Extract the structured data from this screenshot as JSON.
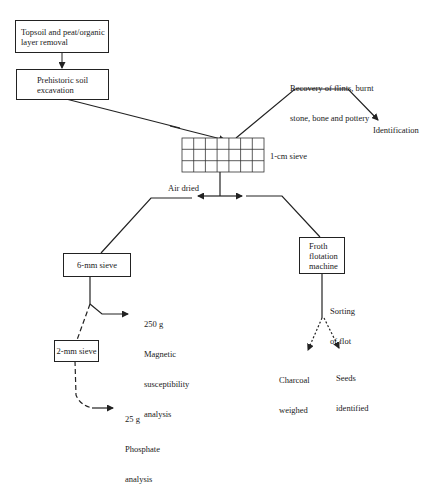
{
  "diagram": {
    "type": "flowchart",
    "nodes": {
      "topsoil": {
        "label": "Topsoil and peat/organic layer removal",
        "line1": "Topsoil and peat/organic",
        "line2": "layer removal"
      },
      "prehistoric": {
        "label": "Prehistoric soil excavation",
        "line1": "Prehistoric soil",
        "line2": "excavation"
      },
      "sieve_1cm": {
        "label": "1-cm sieve",
        "grid": {
          "columns": 7,
          "rows": 3
        }
      },
      "recovery": {
        "line1": "Recovery of flints, burnt",
        "line2": "stone, bone and pottery"
      },
      "identification": {
        "label": "Identification"
      },
      "air_dried": {
        "label": "Air dried"
      },
      "sieve_6mm": {
        "label": "6-mm sieve"
      },
      "magnetic": {
        "line1": "250 g",
        "line2": "Magnetic",
        "line3": "susceptibility",
        "line4": "analysis"
      },
      "sieve_2mm": {
        "label": "2-mm sieve"
      },
      "phosphate": {
        "line1": "25 g",
        "line2": "Phosphate",
        "line3": "analysis"
      },
      "froth": {
        "line1": "Froth",
        "line2": "flotation",
        "line3": "machine"
      },
      "sorting": {
        "line1": "Sorting",
        "line2": "of flot"
      },
      "charcoal": {
        "line1": "Charcoal",
        "line2": "weighed"
      },
      "seeds": {
        "line1": "Seeds",
        "line2": "identified"
      }
    },
    "edges": [
      {
        "from": "topsoil",
        "to": "prehistoric",
        "style": "solid",
        "arrow": true
      },
      {
        "from": "prehistoric",
        "to": "sieve_1cm",
        "style": "solid",
        "arrow": true
      },
      {
        "from": "sieve_1cm",
        "to": "recovery",
        "style": "solid",
        "arrow": false
      },
      {
        "from": "recovery",
        "to": "identification",
        "style": "solid",
        "arrow": true
      },
      {
        "from": "sieve_1cm",
        "to": "air_dried",
        "style": "solid",
        "arrow": true
      },
      {
        "from": "sieve_1cm",
        "to": "froth",
        "style": "solid",
        "arrow": true
      },
      {
        "from": "air_dried",
        "to": "sieve_6mm",
        "style": "solid",
        "arrow": false
      },
      {
        "from": "sieve_6mm",
        "to": "magnetic",
        "style": "solid",
        "arrow": true
      },
      {
        "from": "sieve_6mm",
        "to": "sieve_2mm",
        "style": "dashed",
        "arrow": false
      },
      {
        "from": "sieve_2mm",
        "to": "phosphate",
        "style": "dashed",
        "arrow": true
      },
      {
        "from": "froth",
        "to": "charcoal",
        "style": "dotted",
        "arrow": true
      },
      {
        "from": "froth",
        "to": "seeds",
        "style": "dotted",
        "arrow": true
      }
    ],
    "colors": {
      "line": "#222222",
      "background": "#ffffff",
      "text": "#1a1a1a"
    }
  }
}
